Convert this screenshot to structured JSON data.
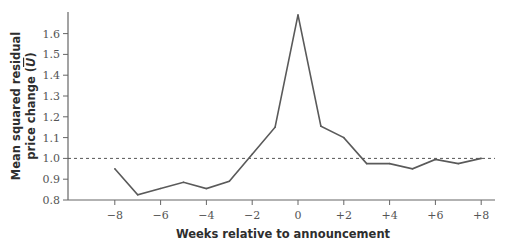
{
  "chart_data": {
    "type": "line",
    "title": "",
    "xlabel": "Weeks relative to announcement",
    "ylabel_line1": "Mean squared residual",
    "ylabel_line2_prefix": "price change (",
    "ylabel_symbol": "U",
    "ylabel_line2_suffix": ")",
    "x": [
      -8,
      -7,
      -6,
      -5,
      -4,
      -3,
      -2,
      -1,
      0,
      1,
      2,
      3,
      4,
      5,
      6,
      7,
      8
    ],
    "series": [
      {
        "name": "Mean squared residual price change",
        "values": [
          0.95,
          0.825,
          0.855,
          0.885,
          0.855,
          0.89,
          1.02,
          1.15,
          1.69,
          1.155,
          1.1,
          0.975,
          0.975,
          0.95,
          0.995,
          0.975,
          1.0
        ],
        "color": "#5a5a5a"
      }
    ],
    "reference_line": {
      "y": 1.0,
      "style": "dashed",
      "color": "#555555"
    },
    "xlim": [
      -10.2,
      8.6
    ],
    "ylim": [
      0.8,
      1.73
    ],
    "xticks": [
      -8,
      -6,
      -4,
      -2,
      0,
      2,
      4,
      6,
      8
    ],
    "xtick_labels": [
      "−8",
      "−6",
      "−4",
      "−2",
      "0",
      "+2",
      "+4",
      "+6",
      "+8"
    ],
    "yticks": [
      0.8,
      0.9,
      1.0,
      1.1,
      1.2,
      1.3,
      1.4,
      1.5,
      1.6
    ],
    "ytick_labels": [
      "0.8",
      "0.9",
      "1.0",
      "1.1",
      "1.2",
      "1.3",
      "1.4",
      "1.5",
      "1.6"
    ],
    "grid": false,
    "legend": "none"
  }
}
